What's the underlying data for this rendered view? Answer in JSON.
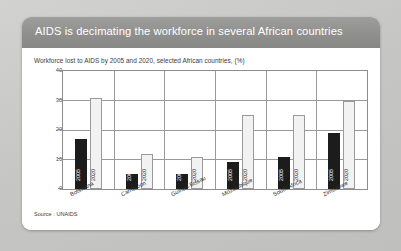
{
  "slide": {
    "title": "AIDS is decimating the workforce in several African countries",
    "subtitle": "Workforce lost to AIDS by 2005 and 2020, selected African countries, (%)",
    "source": "Source : UNAIDS"
  },
  "colors": {
    "header_bar": "#8f8f8d",
    "card_background": "#ffffff",
    "slide_background": "#c9c9c7",
    "series_2005": "#1c1c1c",
    "series_2020": "#f2f2f2",
    "axis": "#8d8d8d",
    "gridline": "#9a9a9a"
  },
  "chart_data": {
    "type": "bar",
    "title": "Workforce lost to AIDS by 2005 and 2020, selected African countries, (%)",
    "xlabel": "",
    "ylabel": "",
    "ylim": [
      0,
      40
    ],
    "yticks": [
      0,
      10,
      20,
      30,
      40
    ],
    "grid": true,
    "legend": "none",
    "bar_value_labels": false,
    "categories": [
      "Botswana",
      "Cameroon",
      "Guinea-Bissau",
      "Mozambique",
      "South Africa",
      "Zimbabwe"
    ],
    "series": [
      {
        "name": "2005",
        "values": [
          17,
          5,
          5,
          9,
          11,
          19
        ]
      },
      {
        "name": "2020",
        "values": [
          31,
          12,
          11,
          25,
          25,
          30
        ]
      }
    ]
  }
}
